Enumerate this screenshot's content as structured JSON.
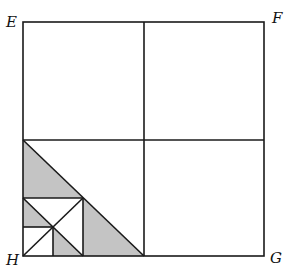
{
  "diagram": {
    "labels": {
      "top_left": "E",
      "top_right": "F",
      "bottom_right": "G",
      "bottom_left": "H"
    },
    "colors": {
      "stroke": "#1a1a1a",
      "shade": "#c4c4c4",
      "background": "#ffffff"
    }
  }
}
